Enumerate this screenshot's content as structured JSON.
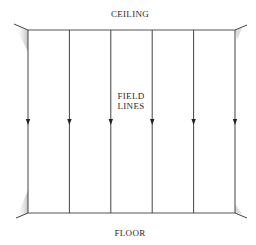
{
  "diagram": {
    "labels": {
      "top": "CEILING",
      "center_line1": "FIELD",
      "center_line2": "LINES",
      "bottom": "FLOOR"
    },
    "field_line_count": 6,
    "field_direction": "downward",
    "colors": {
      "line": "#444444",
      "text": "#2a2a2a",
      "hatch": "#999999"
    }
  }
}
